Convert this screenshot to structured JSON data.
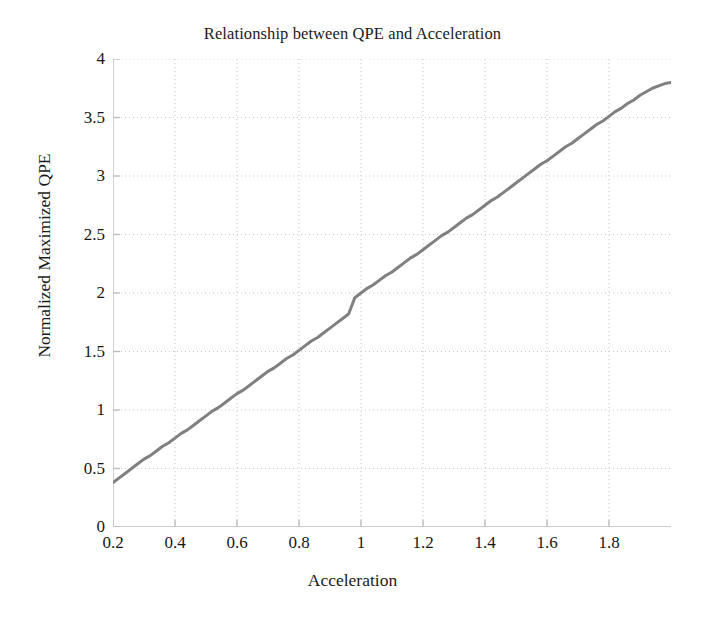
{
  "chart_data": {
    "type": "line",
    "title": "Relationship between QPE and Acceleration",
    "xlabel": "Acceleration",
    "ylabel": "Normalized Maximized QPE",
    "xlim": [
      0.2,
      2.0
    ],
    "ylim": [
      0,
      4
    ],
    "grid": true,
    "legend": null,
    "legend_position": "none",
    "line_color": "#808080",
    "line_width_px": 3,
    "xticks": [
      0.2,
      0.4,
      0.6,
      0.8,
      1,
      1.2,
      1.4,
      1.6,
      1.8
    ],
    "xtick_labels": [
      "0.2",
      "0.4",
      "0.6",
      "0.8",
      "1",
      "1.2",
      "1.4",
      "1.6",
      "1.8"
    ],
    "yticks": [
      0,
      0.5,
      1,
      1.5,
      2,
      2.5,
      3,
      3.5,
      4
    ],
    "ytick_labels": [
      "0",
      "0.5",
      "1",
      "1.5",
      "2",
      "2.5",
      "3",
      "3.5",
      "4"
    ],
    "series": [
      {
        "name": "Normalized Maximized QPE",
        "color": "#808080",
        "x": [
          0.2,
          0.22,
          0.24,
          0.26,
          0.28,
          0.3,
          0.32,
          0.34,
          0.36,
          0.38,
          0.4,
          0.42,
          0.44,
          0.46,
          0.48,
          0.5,
          0.52,
          0.54,
          0.56,
          0.58,
          0.6,
          0.62,
          0.64,
          0.66,
          0.68,
          0.7,
          0.72,
          0.74,
          0.76,
          0.78,
          0.8,
          0.82,
          0.84,
          0.86,
          0.88,
          0.9,
          0.92,
          0.94,
          0.96,
          0.98,
          1.0,
          1.02,
          1.04,
          1.06,
          1.08,
          1.1,
          1.12,
          1.14,
          1.16,
          1.18,
          1.2,
          1.22,
          1.24,
          1.26,
          1.28,
          1.3,
          1.32,
          1.34,
          1.36,
          1.38,
          1.4,
          1.42,
          1.44,
          1.46,
          1.48,
          1.5,
          1.52,
          1.54,
          1.56,
          1.58,
          1.6,
          1.62,
          1.64,
          1.66,
          1.68,
          1.7,
          1.72,
          1.74,
          1.76,
          1.78,
          1.8,
          1.82,
          1.84,
          1.86,
          1.88,
          1.9,
          1.92,
          1.94,
          1.96,
          1.98,
          2.0
        ],
        "y": [
          0.38,
          0.42,
          0.46,
          0.5,
          0.54,
          0.58,
          0.61,
          0.65,
          0.69,
          0.72,
          0.76,
          0.8,
          0.83,
          0.87,
          0.91,
          0.95,
          0.99,
          1.02,
          1.06,
          1.1,
          1.14,
          1.17,
          1.21,
          1.25,
          1.29,
          1.33,
          1.36,
          1.4,
          1.44,
          1.47,
          1.51,
          1.55,
          1.59,
          1.62,
          1.66,
          1.7,
          1.74,
          1.78,
          1.82,
          1.96,
          2.0,
          2.04,
          2.07,
          2.11,
          2.15,
          2.18,
          2.22,
          2.26,
          2.3,
          2.33,
          2.37,
          2.41,
          2.45,
          2.49,
          2.52,
          2.56,
          2.6,
          2.64,
          2.67,
          2.71,
          2.75,
          2.79,
          2.82,
          2.86,
          2.9,
          2.94,
          2.98,
          3.02,
          3.06,
          3.1,
          3.13,
          3.17,
          3.21,
          3.25,
          3.28,
          3.32,
          3.36,
          3.4,
          3.44,
          3.47,
          3.51,
          3.55,
          3.58,
          3.62,
          3.65,
          3.69,
          3.72,
          3.75,
          3.77,
          3.79,
          3.8
        ]
      }
    ],
    "relationship": "approximately linear, y ~= 1.9 * x, with small measurement noise"
  }
}
